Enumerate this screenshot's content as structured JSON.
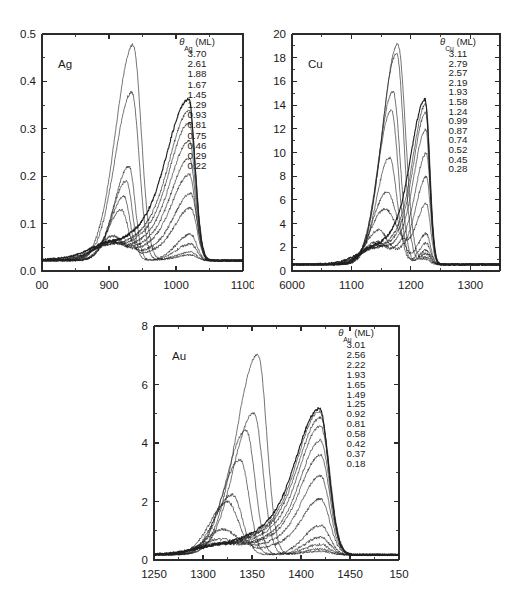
{
  "figure": {
    "background": "#ffffff",
    "line_color": "#1f1f1f",
    "axis_color": "#2b2b2b"
  },
  "chart_data": [
    {
      "type": "line",
      "id": "ag",
      "title": "Ag",
      "panel_label": "Ag",
      "legend_title": "θ",
      "legend_subscript": "Ag",
      "legend_units": "(ML)",
      "legend_header": "θAg (ML)",
      "xlabel": "",
      "ylabel": "",
      "xlim": [
        800,
        1100
      ],
      "ylim": [
        0.0,
        0.5
      ],
      "xticks": [
        800,
        900,
        1000,
        1100
      ],
      "xticklabels": [
        "00",
        "900",
        "1000",
        "1100"
      ],
      "yticks": [
        0.0,
        0.1,
        0.2,
        0.3,
        0.4,
        0.5
      ],
      "yticklabels": [
        "0.0",
        "0.1",
        "0.2",
        "0.3",
        "0.4",
        "0.5"
      ],
      "x_minor_count": 1,
      "y_minor_count": 1,
      "grid": false,
      "legend_position": "top-right",
      "legend_entries": [
        "3.70",
        "2.61",
        "1.88",
        "1.67",
        "1.45",
        "1.29",
        "0.93",
        "0.81",
        "0.75",
        "0.46",
        "0.29",
        "0.22"
      ],
      "peak_a_center": 935,
      "peak_b_center": 1022,
      "series": [
        {
          "name": "3.70",
          "coverage": 3.7,
          "peakA": {
            "center": 936,
            "height": 0.455,
            "widthL": 26,
            "widthR": 12
          },
          "peakB": {
            "center": 1022,
            "height": 0.012,
            "widthL": 22,
            "widthR": 9
          },
          "baseline": 0.022,
          "bold": false
        },
        {
          "name": "2.61",
          "coverage": 2.61,
          "peakA": {
            "center": 934,
            "height": 0.355,
            "widthL": 25,
            "widthR": 11
          },
          "peakB": {
            "center": 1022,
            "height": 0.018,
            "widthL": 22,
            "widthR": 9
          },
          "baseline": 0.022,
          "bold": false
        },
        {
          "name": "1.88",
          "coverage": 1.88,
          "peakA": {
            "center": 930,
            "height": 0.198,
            "widthL": 22,
            "widthR": 9
          },
          "peakB": {
            "center": 1022,
            "height": 0.035,
            "widthL": 22,
            "widthR": 9
          },
          "baseline": 0.022,
          "bold": false
        },
        {
          "name": "1.67",
          "coverage": 1.67,
          "peakA": {
            "center": 926,
            "height": 0.168,
            "widthL": 21,
            "widthR": 9
          },
          "peakB": {
            "center": 1022,
            "height": 0.055,
            "widthL": 22,
            "widthR": 9
          },
          "baseline": 0.022,
          "bold": false
        },
        {
          "name": "1.45",
          "coverage": 1.45,
          "peakA": {
            "center": 922,
            "height": 0.128,
            "widthL": 20,
            "widthR": 9
          },
          "peakB": {
            "center": 1022,
            "height": 0.078,
            "widthL": 22,
            "widthR": 9
          },
          "baseline": 0.022,
          "bold": false
        },
        {
          "name": "1.29",
          "coverage": 1.29,
          "peakA": {
            "center": 918,
            "height": 0.098,
            "widthL": 20,
            "widthR": 10
          },
          "peakB": {
            "center": 1022,
            "height": 0.1,
            "widthL": 23,
            "widthR": 9
          },
          "baseline": 0.022,
          "bold": false
        },
        {
          "name": "0.93",
          "coverage": 0.93,
          "peakA": {
            "center": 905,
            "height": 0.042,
            "widthL": 22,
            "widthR": 14
          },
          "peakB": {
            "center": 1020,
            "height": 0.128,
            "widthL": 24,
            "widthR": 9
          },
          "baseline": 0.022,
          "bold": false
        },
        {
          "name": "0.81",
          "coverage": 0.81,
          "peakA": {
            "center": 900,
            "height": 0.03,
            "widthL": 22,
            "widthR": 16
          },
          "peakB": {
            "center": 1020,
            "height": 0.152,
            "widthL": 25,
            "widthR": 9
          },
          "baseline": 0.022,
          "bold": false
        },
        {
          "name": "0.75",
          "coverage": 0.75,
          "peakA": {
            "center": 898,
            "height": 0.024,
            "widthL": 22,
            "widthR": 16
          },
          "peakB": {
            "center": 1020,
            "height": 0.178,
            "widthL": 26,
            "widthR": 9
          },
          "baseline": 0.022,
          "bold": false
        },
        {
          "name": "0.46",
          "coverage": 0.46,
          "peakA": {
            "center": 895,
            "height": 0.016,
            "widthL": 22,
            "widthR": 16
          },
          "peakB": {
            "center": 1020,
            "height": 0.205,
            "widthL": 27,
            "widthR": 9
          },
          "baseline": 0.022,
          "bold": false
        },
        {
          "name": "0.29",
          "coverage": 0.29,
          "peakA": {
            "center": 893,
            "height": 0.012,
            "widthL": 22,
            "widthR": 16
          },
          "peakB": {
            "center": 1020,
            "height": 0.222,
            "widthL": 28,
            "widthR": 9
          },
          "baseline": 0.022,
          "bold": false
        },
        {
          "name": "0.22",
          "coverage": 0.22,
          "peakA": {
            "center": 890,
            "height": 0.01,
            "widthL": 22,
            "widthR": 16
          },
          "peakB": {
            "center": 1019,
            "height": 0.24,
            "widthL": 30,
            "widthR": 9
          },
          "baseline": 0.022,
          "bold": true
        }
      ]
    },
    {
      "type": "line",
      "id": "cu",
      "title": "Cu",
      "panel_label": "Cu",
      "legend_title": "θ",
      "legend_subscript": "Cu",
      "legend_units": "(ML)",
      "legend_header": "θCu (ML)",
      "xlabel": "",
      "ylabel": "",
      "xlim": [
        1000,
        1350
      ],
      "ylim": [
        0,
        20
      ],
      "xticks": [
        1000,
        1100,
        1200,
        1300
      ],
      "xticklabels": [
        "6000",
        "1100",
        "1200",
        "1300"
      ],
      "yticks": [
        0,
        2,
        4,
        6,
        8,
        10,
        12,
        14,
        16,
        18,
        20
      ],
      "yticklabels": [
        "0",
        "2",
        "4",
        "6",
        "8",
        "10",
        "12",
        "14",
        "16",
        "18",
        "20"
      ],
      "x_minor_count": 1,
      "y_minor_count": 1,
      "grid": false,
      "legend_position": "top-right",
      "legend_entries": [
        "3.11",
        "2.79",
        "2.57",
        "2.19",
        "1.93",
        "1.58",
        "1.24",
        "0.99",
        "0.87",
        "0.74",
        "0.52",
        "0.45",
        "0.28"
      ],
      "peak_a_center": 1175,
      "peak_b_center": 1225,
      "series": [
        {
          "name": "3.11",
          "coverage": 3.11,
          "peakA": {
            "center": 1178,
            "height": 18.6,
            "widthL": 26,
            "widthR": 13
          },
          "peakB": {
            "center": 1226,
            "height": 0.4,
            "widthL": 12,
            "widthR": 7
          },
          "baseline": 0.55,
          "bold": false
        },
        {
          "name": "2.79",
          "coverage": 2.79,
          "peakA": {
            "center": 1176,
            "height": 17.8,
            "widthL": 25,
            "widthR": 12
          },
          "peakB": {
            "center": 1226,
            "height": 0.6,
            "widthL": 12,
            "widthR": 7
          },
          "baseline": 0.55,
          "bold": false
        },
        {
          "name": "2.57",
          "coverage": 2.57,
          "peakA": {
            "center": 1170,
            "height": 14.6,
            "widthL": 24,
            "widthR": 12
          },
          "peakB": {
            "center": 1226,
            "height": 0.9,
            "widthL": 12,
            "widthR": 7
          },
          "baseline": 0.55,
          "bold": false
        },
        {
          "name": "2.19",
          "coverage": 2.19,
          "peakA": {
            "center": 1167,
            "height": 13.0,
            "widthL": 23,
            "widthR": 12
          },
          "peakB": {
            "center": 1226,
            "height": 1.2,
            "widthL": 12,
            "widthR": 7
          },
          "baseline": 0.55,
          "bold": false
        },
        {
          "name": "1.93",
          "coverage": 1.93,
          "peakA": {
            "center": 1164,
            "height": 9.0,
            "widthL": 22,
            "widthR": 13
          },
          "peakB": {
            "center": 1226,
            "height": 1.8,
            "widthL": 13,
            "widthR": 7
          },
          "baseline": 0.55,
          "bold": false
        },
        {
          "name": "1.58",
          "coverage": 1.58,
          "peakA": {
            "center": 1160,
            "height": 6.1,
            "widthL": 24,
            "widthR": 18
          },
          "peakB": {
            "center": 1226,
            "height": 2.6,
            "widthL": 14,
            "widthR": 7
          },
          "baseline": 0.55,
          "bold": false
        },
        {
          "name": "1.24",
          "coverage": 1.24,
          "peakA": {
            "center": 1155,
            "height": 4.4,
            "widthL": 24,
            "widthR": 20
          },
          "peakB": {
            "center": 1226,
            "height": 3.6,
            "widthL": 15,
            "widthR": 7
          },
          "baseline": 0.55,
          "bold": false
        },
        {
          "name": "0.99",
          "coverage": 0.99,
          "peakA": {
            "center": 1145,
            "height": 2.6,
            "widthL": 22,
            "widthR": 14
          },
          "peakB": {
            "center": 1226,
            "height": 5.2,
            "widthL": 16,
            "widthR": 7
          },
          "baseline": 0.55,
          "bold": false
        },
        {
          "name": "0.87",
          "coverage": 0.87,
          "peakA": {
            "center": 1140,
            "height": 1.5,
            "widthL": 22,
            "widthR": 14
          },
          "peakB": {
            "center": 1226,
            "height": 6.6,
            "widthL": 17,
            "widthR": 7
          },
          "baseline": 0.55,
          "bold": false
        },
        {
          "name": "0.74",
          "coverage": 0.74,
          "peakA": {
            "center": 1135,
            "height": 1.0,
            "widthL": 22,
            "widthR": 16
          },
          "peakB": {
            "center": 1225,
            "height": 8.0,
            "widthL": 18,
            "widthR": 7
          },
          "baseline": 0.55,
          "bold": false
        },
        {
          "name": "0.52",
          "coverage": 0.52,
          "peakA": {
            "center": 1130,
            "height": 0.7,
            "widthL": 22,
            "widthR": 16
          },
          "peakB": {
            "center": 1225,
            "height": 9.0,
            "widthL": 19,
            "widthR": 7
          },
          "baseline": 0.55,
          "bold": false
        },
        {
          "name": "0.45",
          "coverage": 0.45,
          "peakA": {
            "center": 1128,
            "height": 0.5,
            "widthL": 22,
            "widthR": 16
          },
          "peakB": {
            "center": 1225,
            "height": 9.5,
            "widthL": 20,
            "widthR": 7
          },
          "baseline": 0.55,
          "bold": false
        },
        {
          "name": "0.28",
          "coverage": 0.28,
          "peakA": {
            "center": 1125,
            "height": 0.4,
            "widthL": 22,
            "widthR": 16
          },
          "peakB": {
            "center": 1224,
            "height": 9.8,
            "widthL": 22,
            "widthR": 7
          },
          "baseline": 0.55,
          "bold": true
        }
      ]
    },
    {
      "type": "line",
      "id": "au",
      "title": "Au",
      "panel_label": "Au",
      "legend_title": "θ",
      "legend_subscript": "Au",
      "legend_units": "(ML)",
      "legend_header": "θAu (ML)",
      "xlabel": "",
      "ylabel": "",
      "xlim": [
        1250,
        1500
      ],
      "ylim": [
        0,
        8
      ],
      "xticks": [
        1250,
        1300,
        1350,
        1400,
        1450,
        1500
      ],
      "xticklabels": [
        "1250",
        "1300",
        "1350",
        "1400",
        "1450",
        "150"
      ],
      "yticks": [
        0,
        2,
        4,
        6,
        8
      ],
      "yticklabels": [
        "0",
        "2",
        "4",
        "6",
        "8"
      ],
      "x_minor_count": 1,
      "y_minor_count": 1,
      "grid": false,
      "legend_position": "top-right",
      "legend_entries": [
        "3.01",
        "2.56",
        "2.22",
        "1.93",
        "1.65",
        "1.49",
        "1.25",
        "0.92",
        "0.81",
        "0.58",
        "0.42",
        "0.37",
        "0.18"
      ],
      "peak_a_center": 1355,
      "peak_b_center": 1420,
      "series": [
        {
          "name": "3.01",
          "coverage": 3.01,
          "peakA": {
            "center": 1356,
            "height": 6.85,
            "widthL": 22,
            "widthR": 9
          },
          "peakB": {
            "center": 1420,
            "height": 0.12,
            "widthL": 16,
            "widthR": 9
          },
          "baseline": 0.18,
          "bold": false
        },
        {
          "name": "2.56",
          "coverage": 2.56,
          "peakA": {
            "center": 1352,
            "height": 4.85,
            "widthL": 21,
            "widthR": 9
          },
          "peakB": {
            "center": 1420,
            "height": 0.2,
            "widthL": 16,
            "widthR": 9
          },
          "baseline": 0.18,
          "bold": false
        },
        {
          "name": "2.22",
          "coverage": 2.22,
          "peakA": {
            "center": 1344,
            "height": 4.25,
            "widthL": 20,
            "widthR": 9
          },
          "peakB": {
            "center": 1420,
            "height": 0.35,
            "widthL": 16,
            "widthR": 9
          },
          "baseline": 0.18,
          "bold": false
        },
        {
          "name": "1.93",
          "coverage": 1.93,
          "peakA": {
            "center": 1338,
            "height": 3.25,
            "widthL": 19,
            "widthR": 9
          },
          "peakB": {
            "center": 1420,
            "height": 0.6,
            "widthL": 16,
            "widthR": 9
          },
          "baseline": 0.18,
          "bold": false
        },
        {
          "name": "1.65",
          "coverage": 1.65,
          "peakA": {
            "center": 1330,
            "height": 2.05,
            "widthL": 18,
            "widthR": 10
          },
          "peakB": {
            "center": 1420,
            "height": 1.0,
            "widthL": 17,
            "widthR": 9
          },
          "baseline": 0.18,
          "bold": false
        },
        {
          "name": "1.49",
          "coverage": 1.49,
          "peakA": {
            "center": 1325,
            "height": 1.75,
            "widthL": 18,
            "widthR": 11
          },
          "peakB": {
            "center": 1420,
            "height": 1.35,
            "widthL": 17,
            "widthR": 9
          },
          "baseline": 0.18,
          "bold": false
        },
        {
          "name": "1.25",
          "coverage": 1.25,
          "peakA": {
            "center": 1320,
            "height": 0.78,
            "widthL": 18,
            "widthR": 14
          },
          "peakB": {
            "center": 1420,
            "height": 1.9,
            "widthL": 18,
            "widthR": 9
          },
          "baseline": 0.18,
          "bold": false
        },
        {
          "name": "0.92",
          "coverage": 0.92,
          "peakA": {
            "center": 1315,
            "height": 0.42,
            "widthL": 20,
            "widthR": 16
          },
          "peakB": {
            "center": 1420,
            "height": 2.4,
            "widthL": 19,
            "widthR": 9
          },
          "baseline": 0.18,
          "bold": false
        },
        {
          "name": "0.81",
          "coverage": 0.81,
          "peakA": {
            "center": 1312,
            "height": 0.28,
            "widthL": 20,
            "widthR": 16
          },
          "peakB": {
            "center": 1420,
            "height": 2.75,
            "widthL": 19,
            "widthR": 9
          },
          "baseline": 0.18,
          "bold": false
        },
        {
          "name": "0.58",
          "coverage": 0.58,
          "peakA": {
            "center": 1310,
            "height": 0.2,
            "widthL": 20,
            "widthR": 16
          },
          "peakB": {
            "center": 1420,
            "height": 3.1,
            "widthL": 20,
            "widthR": 9
          },
          "baseline": 0.18,
          "bold": false
        },
        {
          "name": "0.42",
          "coverage": 0.42,
          "peakA": {
            "center": 1308,
            "height": 0.15,
            "widthL": 20,
            "widthR": 16
          },
          "peakB": {
            "center": 1420,
            "height": 3.3,
            "widthL": 21,
            "widthR": 9
          },
          "baseline": 0.18,
          "bold": false
        },
        {
          "name": "0.37",
          "coverage": 0.37,
          "peakA": {
            "center": 1306,
            "height": 0.12,
            "widthL": 20,
            "widthR": 16
          },
          "peakB": {
            "center": 1419,
            "height": 3.45,
            "widthL": 21,
            "widthR": 9
          },
          "baseline": 0.18,
          "bold": false
        },
        {
          "name": "0.18",
          "coverage": 0.18,
          "peakA": {
            "center": 1305,
            "height": 0.1,
            "widthL": 20,
            "widthR": 16
          },
          "peakB": {
            "center": 1419,
            "height": 3.52,
            "widthL": 22,
            "widthR": 9
          },
          "baseline": 0.18,
          "bold": true
        }
      ]
    }
  ]
}
